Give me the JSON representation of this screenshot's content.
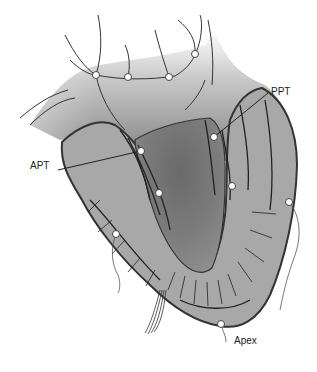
{
  "diagram": {
    "type": "anatomical-illustration",
    "labels": [
      {
        "id": "apt",
        "text": "APT",
        "x": 30,
        "y": 166,
        "anchor": [
          141,
          151
        ]
      },
      {
        "id": "ppt",
        "text": "PPT",
        "x": 271,
        "y": 86,
        "anchor": [
          214,
          137
        ]
      },
      {
        "id": "apex",
        "text": "Apex",
        "x": 234,
        "y": 335,
        "anchor": [
          221,
          324
        ]
      }
    ],
    "markers": [
      {
        "x": 96,
        "y": 75
      },
      {
        "x": 128,
        "y": 77
      },
      {
        "x": 169,
        "y": 77
      },
      {
        "x": 195,
        "y": 54
      },
      {
        "x": 141,
        "y": 151
      },
      {
        "x": 214,
        "y": 137
      },
      {
        "x": 159,
        "y": 193
      },
      {
        "x": 232,
        "y": 186
      },
      {
        "x": 289,
        "y": 202
      },
      {
        "x": 116,
        "y": 234
      },
      {
        "x": 221,
        "y": 324
      }
    ],
    "colors": {
      "background": "#ffffff",
      "wall": "#a8a8a8",
      "cavity_dark": "#6e6e6e",
      "outline": "#333333",
      "marker_fill": "#ffffff"
    }
  }
}
